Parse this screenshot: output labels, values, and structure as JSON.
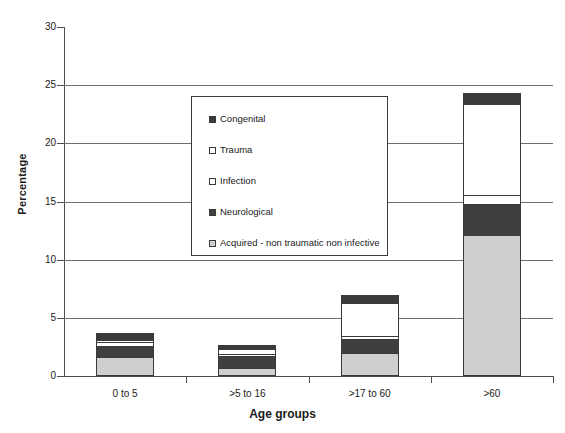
{
  "chart_data": {
    "type": "bar",
    "subtype": "stacked-bar",
    "title": "",
    "xlabel": "Age groups",
    "ylabel": "Percentage",
    "categories": [
      "0 to 5",
      ">5 to 16",
      ">17 to 60",
      ">60"
    ],
    "ylim": [
      0,
      30
    ],
    "yticks": [
      0,
      5,
      10,
      15,
      20,
      25,
      30
    ],
    "grid": "horizontal",
    "legend_position": "inside-upper-center",
    "series": [
      {
        "name": "Acquired - non traumatic non infective",
        "color": "#cfcfcf",
        "values": [
          1.6,
          0.7,
          2.0,
          12.1
        ]
      },
      {
        "name": "Neurological",
        "color": "#3f3f3f",
        "values": [
          1.0,
          1.0,
          1.2,
          2.7
        ]
      },
      {
        "name": "Infection",
        "color": "#ffffff",
        "values": [
          0.3,
          0.2,
          0.25,
          0.8
        ]
      },
      {
        "name": "Trauma",
        "color": "#ffffff",
        "values": [
          0.2,
          0.4,
          2.8,
          7.8
        ]
      },
      {
        "name": "Congenital",
        "color": "#3a3a3a",
        "values": [
          0.6,
          0.4,
          0.7,
          0.95
        ]
      }
    ],
    "totals": [
      3.7,
      2.7,
      6.95,
      24.35
    ]
  },
  "axes": {
    "y_title": "Percentage",
    "x_title": "Age groups",
    "y_tick_labels": [
      "30",
      "25",
      "20",
      "15",
      "10",
      "5",
      "0"
    ],
    "x_tick_labels": [
      "0 to 5",
      ">5 to 16",
      ">17 to 60",
      ">60"
    ]
  },
  "legend": {
    "items": [
      {
        "label": "Congenital",
        "swatch": "#3a3a3a"
      },
      {
        "label": "Trauma",
        "swatch": "#ffffff"
      },
      {
        "label": "Infection",
        "swatch": "#ffffff"
      },
      {
        "label": "Neurological",
        "swatch": "#3f3f3f"
      },
      {
        "label": "Acquired - non traumatic non infective",
        "swatch": "#cfcfcf"
      }
    ]
  },
  "colors": {
    "axis": "#4d4d4d",
    "grid": "#6e6e6e",
    "bar_outline": "#3a3a3a",
    "background": "#ffffff",
    "text": "#1a1a1a"
  }
}
